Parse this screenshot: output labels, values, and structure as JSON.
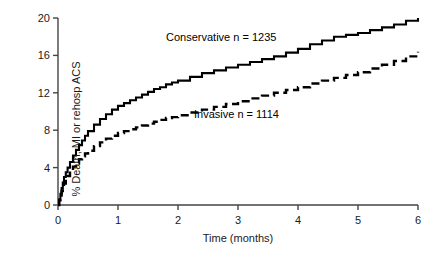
{
  "chart_data": {
    "type": "line",
    "title": "",
    "subtitle": "",
    "xlabel": "Time (months)",
    "ylabel": "% Death, MI or rehosp ACS",
    "xlim": [
      0,
      6
    ],
    "ylim": [
      0,
      20
    ],
    "xticks": [
      0,
      1,
      2,
      3,
      4,
      5,
      6
    ],
    "xtick_labels": [
      "0",
      "1",
      "2",
      "3",
      "4",
      "5",
      "6"
    ],
    "yticks": [
      0,
      4,
      8,
      12,
      16,
      20
    ],
    "ytick_labels": [
      "0",
      "4",
      "8",
      "12",
      "16",
      "20"
    ],
    "grid": false,
    "legend_position": "inline-annotation",
    "series": [
      {
        "name": "Conservative",
        "label": "Conservative n = 1235",
        "n": 1235,
        "linestyle": "solid",
        "color": "#000000",
        "x": [
          0.0,
          0.02,
          0.04,
          0.06,
          0.08,
          0.1,
          0.13,
          0.16,
          0.2,
          0.25,
          0.3,
          0.35,
          0.4,
          0.45,
          0.5,
          0.6,
          0.7,
          0.8,
          0.9,
          1.0,
          1.1,
          1.2,
          1.3,
          1.4,
          1.5,
          1.6,
          1.7,
          1.8,
          1.9,
          2.0,
          2.2,
          2.4,
          2.6,
          2.8,
          3.0,
          3.2,
          3.4,
          3.6,
          3.8,
          4.0,
          4.2,
          4.4,
          4.6,
          4.8,
          5.0,
          5.2,
          5.4,
          5.6,
          5.8,
          6.0
        ],
        "y": [
          0.0,
          0.6,
          1.2,
          1.8,
          2.4,
          3.0,
          3.5,
          4.0,
          4.6,
          5.3,
          5.9,
          6.4,
          6.9,
          7.4,
          7.9,
          8.6,
          9.2,
          9.7,
          10.2,
          10.6,
          10.9,
          11.2,
          11.5,
          11.8,
          12.1,
          12.4,
          12.6,
          12.9,
          13.1,
          13.3,
          13.7,
          14.1,
          14.4,
          14.7,
          15.0,
          15.3,
          15.6,
          15.9,
          16.3,
          16.7,
          17.2,
          17.6,
          18.0,
          18.2,
          18.4,
          18.7,
          19.0,
          19.3,
          19.7,
          20.0
        ]
      },
      {
        "name": "Invasive",
        "label": "Invasive n = 1114",
        "n": 1114,
        "linestyle": "dashed",
        "color": "#000000",
        "x": [
          0.0,
          0.02,
          0.04,
          0.06,
          0.08,
          0.1,
          0.13,
          0.16,
          0.2,
          0.25,
          0.3,
          0.35,
          0.4,
          0.45,
          0.5,
          0.6,
          0.7,
          0.8,
          0.9,
          1.0,
          1.1,
          1.2,
          1.3,
          1.4,
          1.5,
          1.6,
          1.7,
          1.8,
          1.9,
          2.0,
          2.2,
          2.4,
          2.6,
          2.8,
          3.0,
          3.2,
          3.4,
          3.6,
          3.8,
          4.0,
          4.2,
          4.4,
          4.6,
          4.8,
          5.0,
          5.2,
          5.4,
          5.6,
          5.8,
          6.0
        ],
        "y": [
          0.0,
          0.5,
          1.0,
          1.5,
          1.9,
          2.3,
          2.7,
          3.1,
          3.6,
          4.1,
          4.5,
          4.9,
          5.2,
          5.5,
          5.8,
          6.3,
          6.7,
          7.1,
          7.4,
          7.7,
          7.9,
          8.1,
          8.3,
          8.5,
          8.7,
          8.9,
          9.1,
          9.3,
          9.4,
          9.6,
          9.9,
          10.2,
          10.5,
          10.8,
          11.1,
          11.4,
          11.7,
          12.0,
          12.3,
          12.6,
          13.0,
          13.3,
          13.6,
          13.9,
          14.2,
          14.6,
          15.0,
          15.4,
          15.9,
          16.4
        ]
      }
    ],
    "annotations": [
      {
        "text": "Conservative n = 1235",
        "x": 2.0,
        "y": 17.2
      },
      {
        "text": "Invasive n = 1114",
        "x": 2.5,
        "y": 9.6
      }
    ]
  }
}
